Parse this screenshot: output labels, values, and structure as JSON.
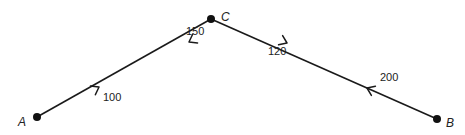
{
  "diagram": {
    "type": "directed-path-network",
    "nodes": [
      {
        "id": "A",
        "label": "A",
        "x": 37,
        "y": 117
      },
      {
        "id": "C",
        "label": "C",
        "x": 211,
        "y": 19
      },
      {
        "id": "B",
        "label": "B",
        "x": 437,
        "y": 119
      }
    ],
    "edges": [
      {
        "from": "A",
        "to": "C",
        "label": "100",
        "direction": "A→C"
      },
      {
        "from": "C",
        "to": "A",
        "label": "150",
        "direction": "C→A"
      },
      {
        "from": "C",
        "to": "B",
        "label": "120",
        "direction": "C→B"
      },
      {
        "from": "B",
        "to": "C",
        "label": "200",
        "direction": "B→C"
      }
    ],
    "labels": {
      "node_a": "A",
      "node_b": "B",
      "node_c": "C",
      "edge_ac": "100",
      "edge_ca": "150",
      "edge_cb": "120",
      "edge_bc": "200"
    },
    "colors": {
      "line": "#1a1a1a",
      "node": "#111111",
      "text": "#222222",
      "background": "#ffffff"
    }
  }
}
